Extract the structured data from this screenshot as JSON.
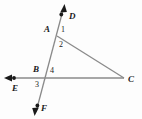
{
  "figure": {
    "type": "geometry-diagram",
    "background_color": "#fdfdfd",
    "line_color": "#808080",
    "label_color": "#1a1a1a"
  },
  "points": [
    {
      "name": "A",
      "label": "A",
      "x": 55,
      "y": 32,
      "label_x": 44,
      "label_y": 27
    },
    {
      "name": "B",
      "label": "B",
      "x": 45,
      "y": 78,
      "label_x": 34,
      "label_y": 68
    },
    {
      "name": "C",
      "label": "C",
      "x": 124,
      "y": 78,
      "label_x": 128,
      "label_y": 78
    },
    {
      "name": "D",
      "label": "D",
      "x": 63,
      "y": 10,
      "label_x": 70,
      "label_y": 12
    },
    {
      "name": "E",
      "label": "E",
      "x": 10,
      "y": 78,
      "label_x": 12,
      "label_y": 86
    },
    {
      "name": "F",
      "label": "F",
      "x": 36,
      "y": 110,
      "label_x": 41,
      "label_y": 107
    }
  ],
  "angles": [
    {
      "name": "angle-1",
      "label": "1",
      "x": 62,
      "y": 29
    },
    {
      "name": "angle-2",
      "label": "2",
      "x": 60,
      "y": 44
    },
    {
      "name": "angle-3",
      "label": "3",
      "x": 36,
      "y": 84
    },
    {
      "name": "angle-4",
      "label": "4",
      "x": 51,
      "y": 70
    }
  ],
  "lines": [
    {
      "name": "line-DF",
      "from": "D",
      "to": "F",
      "arrow_start": true,
      "arrow_end": true
    },
    {
      "name": "line-EC",
      "from": "E",
      "to": "C",
      "arrow_start": true,
      "arrow_end": false
    },
    {
      "name": "segment-AC",
      "from": "A",
      "to": "C",
      "arrow_start": false,
      "arrow_end": false
    }
  ],
  "dots": [
    {
      "name": "dot-D",
      "x": 61,
      "y": 14
    },
    {
      "name": "dot-E",
      "x": 14,
      "y": 78
    },
    {
      "name": "dot-F",
      "x": 37,
      "y": 106
    }
  ]
}
